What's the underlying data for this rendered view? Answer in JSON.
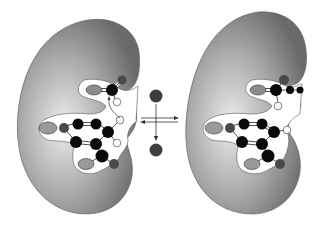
{
  "diagram": {
    "colors": {
      "background": "#ffffff",
      "enzyme_light": "#e6e6e6",
      "enzyme_dark": "#6e6e6e",
      "pocket": "#ffffff",
      "atom_black": "#0a0a0a",
      "atom_dark_gray": "#4a4a4a",
      "atom_mid_gray": "#8c8c8c",
      "atom_white": "#ffffff",
      "arrow": "#333333"
    },
    "left_enzyme": {
      "label": "enzyme-left"
    },
    "right_enzyme": {
      "label": "enzyme-right"
    },
    "equilibrium": {
      "top_ball": "leaving-group",
      "bottom_ball": "leaving-group"
    }
  }
}
